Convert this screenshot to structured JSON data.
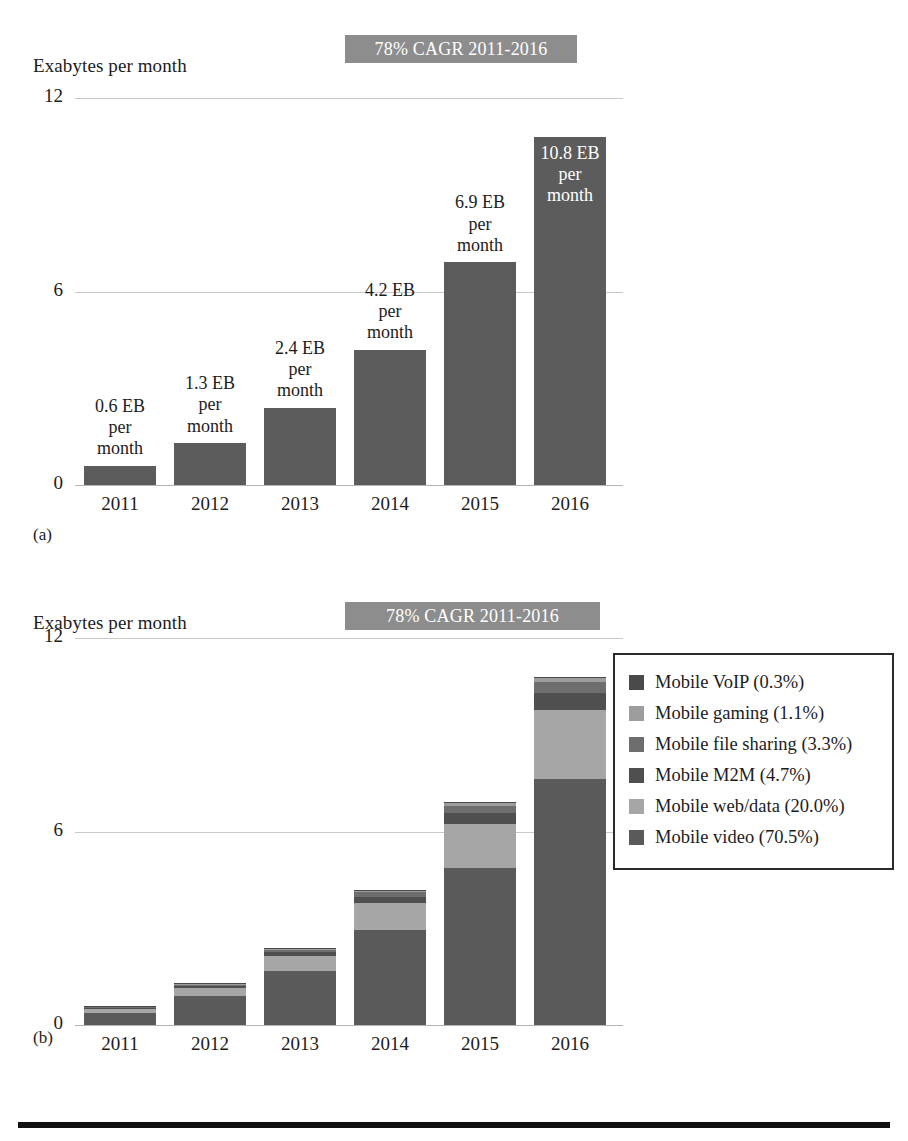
{
  "figure": {
    "bottom_rule_color": "#111111"
  },
  "panel_a": {
    "caption": "(a)",
    "axis_title": "Exabytes per month",
    "badge": "78% CAGR 2011-2016",
    "badge_bg": "#8d8d8d",
    "bar_color": "#5c5c5c",
    "yticks": [
      "12",
      "6",
      "0"
    ],
    "chart_data": {
      "type": "bar",
      "title": "78% CAGR 2011-2016",
      "xlabel": "",
      "ylabel": "Exabytes per month",
      "ylim": [
        0,
        12
      ],
      "yticks": [
        0,
        6,
        12
      ],
      "grid": true,
      "legend": "none",
      "categories": [
        "2011",
        "2012",
        "2013",
        "2014",
        "2015",
        "2016"
      ],
      "values": [
        0.6,
        1.3,
        2.4,
        4.2,
        6.9,
        10.8
      ],
      "data_labels": [
        "0.6 EB\nper\nmonth",
        "1.3 EB\nper\nmonth",
        "2.4 EB\nper\nmonth",
        "4.2 EB\nper\nmonth",
        "6.9 EB\nper\nmonth",
        "10.8 EB\nper\nmonth"
      ],
      "label_inside": [
        false,
        false,
        false,
        false,
        false,
        true
      ]
    }
  },
  "panel_b": {
    "caption": "(b)",
    "axis_title": "Exabytes per month",
    "badge": "78% CAGR 2011-2016",
    "badge_bg": "#8d8d8d",
    "yticks": [
      "12",
      "6",
      "0"
    ],
    "legend_items": [
      {
        "label": "Mobile VoIP (0.3%)",
        "color": "#4a4a4a"
      },
      {
        "label": "Mobile gaming (1.1%)",
        "color": "#9d9d9d"
      },
      {
        "label": "Mobile file sharing (3.3%)",
        "color": "#6e6e6e"
      },
      {
        "label": "Mobile M2M (4.7%)",
        "color": "#4f4f4f"
      },
      {
        "label": "Mobile web/data (20.0%)",
        "color": "#a6a6a6"
      },
      {
        "label": "Mobile video (70.5%)",
        "color": "#5a5a5a"
      }
    ],
    "chart_data": {
      "type": "bar",
      "subtype": "stacked",
      "title": "78% CAGR 2011-2016",
      "xlabel": "",
      "ylabel": "Exabytes per month",
      "ylim": [
        0,
        12
      ],
      "yticks": [
        0,
        6,
        12
      ],
      "grid": true,
      "legend": "right",
      "categories": [
        "2011",
        "2012",
        "2013",
        "2014",
        "2015",
        "2016"
      ],
      "totals": [
        0.6,
        1.3,
        2.4,
        4.2,
        6.9,
        10.8
      ],
      "series": [
        {
          "name": "Mobile video (70.5%)",
          "share_pct": 70.5,
          "color": "#5a5a5a",
          "values": [
            0.42,
            0.92,
            1.69,
            2.96,
            4.86,
            7.61
          ]
        },
        {
          "name": "Mobile web/data (20.0%)",
          "share_pct": 20.0,
          "color": "#a6a6a6",
          "values": [
            0.12,
            0.26,
            0.48,
            0.84,
            1.38,
            2.16
          ]
        },
        {
          "name": "Mobile M2M (4.7%)",
          "share_pct": 4.7,
          "color": "#4f4f4f",
          "values": [
            0.03,
            0.06,
            0.11,
            0.2,
            0.32,
            0.51
          ]
        },
        {
          "name": "Mobile file sharing (3.3%)",
          "share_pct": 3.3,
          "color": "#6e6e6e",
          "values": [
            0.02,
            0.04,
            0.08,
            0.14,
            0.23,
            0.36
          ]
        },
        {
          "name": "Mobile gaming (1.1%)",
          "share_pct": 1.1,
          "color": "#9d9d9d",
          "values": [
            0.01,
            0.01,
            0.03,
            0.05,
            0.08,
            0.12
          ]
        },
        {
          "name": "Mobile VoIP (0.3%)",
          "share_pct": 0.3,
          "color": "#4a4a4a",
          "values": [
            0.0,
            0.0,
            0.01,
            0.01,
            0.02,
            0.03
          ]
        }
      ]
    }
  }
}
